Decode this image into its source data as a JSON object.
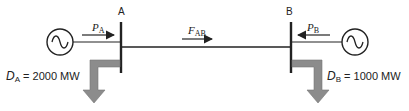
{
  "diagram": {
    "type": "two-bus power system",
    "colors": {
      "line": "#222222",
      "demand_arrow": "#8c8c8c"
    },
    "buses": [
      {
        "id": "A",
        "label": "A"
      },
      {
        "id": "B",
        "label": "B"
      }
    ],
    "generators": [
      {
        "bus": "A",
        "icon": "ac-generator-icon",
        "flow_symbol": "P",
        "flow_sub": "A",
        "direction": "into bus A"
      },
      {
        "bus": "B",
        "icon": "ac-generator-icon",
        "flow_symbol": "P",
        "flow_sub": "B",
        "direction": "into bus B"
      }
    ],
    "line_flow": {
      "symbol": "F",
      "sub": "AB",
      "direction": "A to B"
    },
    "demands": [
      {
        "bus": "A",
        "symbol": "D",
        "sub": "A",
        "value_text": "= 2000 MW"
      },
      {
        "bus": "B",
        "symbol": "D",
        "sub": "B",
        "value_text": "= 1000 MW"
      }
    ]
  }
}
